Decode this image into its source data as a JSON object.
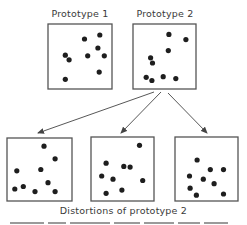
{
  "figure": {
    "labels": {
      "prototype_1": "Prototype 1",
      "prototype_2": "Prototype 2",
      "distortions": "Distortions of prototype 2"
    },
    "colors": {
      "dot": "#1e1e1e",
      "box_border": "#555555",
      "arrow": "#444444"
    },
    "panels": [
      {
        "id": "prototype-1",
        "role": "prototype",
        "dots": [
          [
            0.57,
            0.23
          ],
          [
            0.81,
            0.17
          ],
          [
            0.78,
            0.37
          ],
          [
            0.27,
            0.48
          ],
          [
            0.33,
            0.55
          ],
          [
            0.62,
            0.49
          ],
          [
            0.88,
            0.49
          ],
          [
            0.8,
            0.74
          ],
          [
            0.27,
            0.85
          ]
        ]
      },
      {
        "id": "prototype-2",
        "role": "prototype",
        "dots": [
          [
            0.57,
            0.16
          ],
          [
            0.84,
            0.24
          ],
          [
            0.56,
            0.41
          ],
          [
            0.28,
            0.52
          ],
          [
            0.31,
            0.6
          ],
          [
            0.21,
            0.82
          ],
          [
            0.3,
            0.87
          ],
          [
            0.48,
            0.81
          ],
          [
            0.68,
            0.84
          ]
        ]
      },
      {
        "id": "distortion-1",
        "role": "distortion",
        "source": "prototype-2",
        "dots": [
          [
            0.57,
            0.13
          ],
          [
            0.74,
            0.33
          ],
          [
            0.15,
            0.52
          ],
          [
            0.52,
            0.5
          ],
          [
            0.63,
            0.71
          ],
          [
            0.12,
            0.81
          ],
          [
            0.25,
            0.77
          ],
          [
            0.43,
            0.85
          ],
          [
            0.74,
            0.85
          ]
        ]
      },
      {
        "id": "distortion-2",
        "role": "distortion",
        "source": "prototype-2",
        "dots": [
          [
            0.77,
            0.13
          ],
          [
            0.24,
            0.41
          ],
          [
            0.52,
            0.46
          ],
          [
            0.62,
            0.47
          ],
          [
            0.17,
            0.61
          ],
          [
            0.35,
            0.66
          ],
          [
            0.82,
            0.68
          ],
          [
            0.49,
            0.83
          ],
          [
            0.24,
            0.88
          ]
        ]
      },
      {
        "id": "distortion-3",
        "role": "distortion",
        "source": "prototype-2",
        "dots": [
          [
            0.35,
            0.36
          ],
          [
            0.56,
            0.51
          ],
          [
            0.77,
            0.51
          ],
          [
            0.23,
            0.61
          ],
          [
            0.45,
            0.66
          ],
          [
            0.62,
            0.73
          ],
          [
            0.24,
            0.8
          ],
          [
            0.34,
            0.91
          ],
          [
            0.77,
            0.89
          ]
        ]
      }
    ],
    "arrows": [
      {
        "from": "prototype-2",
        "to": "distortion-1"
      },
      {
        "from": "prototype-2",
        "to": "distortion-2"
      },
      {
        "from": "prototype-2",
        "to": "distortion-3"
      }
    ]
  }
}
